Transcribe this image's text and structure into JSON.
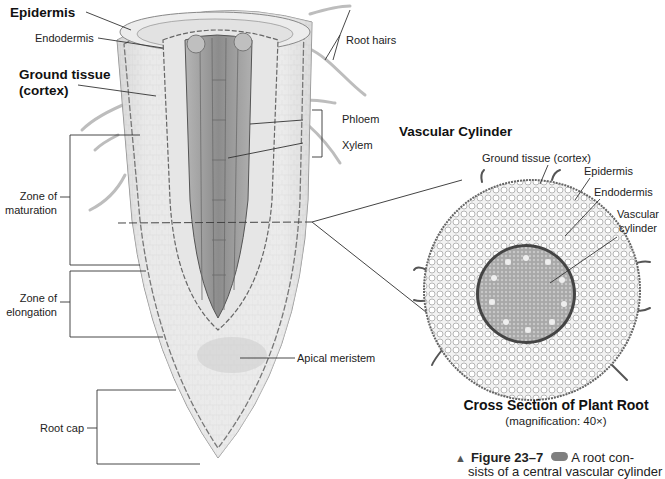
{
  "diagram": {
    "type": "labeled biological illustration"
  },
  "longitudinal_labels": {
    "epidermis": "Epidermis",
    "endodermis": "Endodermis",
    "ground_tissue_line1": "Ground tissue",
    "ground_tissue_line2": "(cortex)",
    "root_hairs": "Root hairs",
    "phloem": "Phloem",
    "xylem": "Xylem",
    "vascular_cylinder": "Vascular Cylinder",
    "zone_maturation_line1": "Zone of",
    "zone_maturation_line2": "maturation",
    "zone_elongation_line1": "Zone of",
    "zone_elongation_line2": "elongation",
    "apical_meristem": "Apical meristem",
    "root_cap": "Root cap"
  },
  "cross_section_labels": {
    "ground_tissue": "Ground tissue (cortex)",
    "epidermis": "Epidermis",
    "endodermis": "Endodermis",
    "vascular_line1": "Vascular",
    "vascular_line2": "cylinder"
  },
  "caption": {
    "title": "Cross Section of Plant Root",
    "magnification": "(magnification: 40×)",
    "figure_number": "Figure 23–7",
    "figure_text_line1": "A root con-",
    "figure_text_line2": "sists of a central vascular cylinder"
  },
  "colors": {
    "line": "#333333",
    "tissue_light": "#e9e9e9",
    "tissue_mid": "#cfcfcf",
    "vascular_dark": "#8e8e8e"
  }
}
